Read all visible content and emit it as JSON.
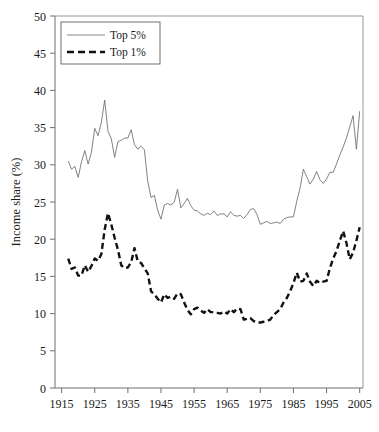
{
  "chart_data": {
    "type": "line",
    "title": "",
    "xlabel": "",
    "ylabel": "Income share (%)",
    "xlim": [
      1913,
      2006
    ],
    "ylim": [
      0,
      50
    ],
    "ytick_step": 5,
    "xtick_step": 10,
    "grid": false,
    "legend_position": "top-left",
    "xticks": [
      1915,
      1925,
      1935,
      1945,
      1955,
      1965,
      1975,
      1985,
      1995,
      2005
    ],
    "yticks": [
      0,
      5,
      10,
      15,
      20,
      25,
      30,
      35,
      40,
      45,
      50
    ],
    "x": [
      1917,
      1918,
      1919,
      1920,
      1921,
      1922,
      1923,
      1924,
      1925,
      1926,
      1927,
      1928,
      1929,
      1930,
      1931,
      1932,
      1933,
      1934,
      1935,
      1936,
      1937,
      1938,
      1939,
      1940,
      1941,
      1942,
      1943,
      1944,
      1945,
      1946,
      1947,
      1948,
      1949,
      1950,
      1951,
      1952,
      1953,
      1954,
      1955,
      1956,
      1957,
      1958,
      1959,
      1960,
      1961,
      1962,
      1963,
      1964,
      1965,
      1966,
      1967,
      1968,
      1969,
      1970,
      1971,
      1972,
      1973,
      1974,
      1975,
      1976,
      1977,
      1978,
      1979,
      1980,
      1981,
      1982,
      1983,
      1984,
      1985,
      1986,
      1987,
      1988,
      1989,
      1990,
      1991,
      1992,
      1993,
      1994,
      1995,
      1996,
      1997,
      1998,
      1999,
      2000,
      2001,
      2002,
      2003,
      2004,
      2005
    ],
    "series": [
      {
        "name": "Top 5%",
        "style": "solid-thin",
        "color": "#6b6b6b",
        "values": [
          30.5,
          29.4,
          29.8,
          28.3,
          30.4,
          31.9,
          30.1,
          31.7,
          34.9,
          33.9,
          35.7,
          38.7,
          34.5,
          33.5,
          31.0,
          33.1,
          33.3,
          33.6,
          33.6,
          34.7,
          32.7,
          32.1,
          32.5,
          32.0,
          27.8,
          25.6,
          25.9,
          23.9,
          22.7,
          24.6,
          24.8,
          24.6,
          25.0,
          26.7,
          24.2,
          24.8,
          25.5,
          24.5,
          23.9,
          23.8,
          23.4,
          23.2,
          23.5,
          23.3,
          23.8,
          23.2,
          23.4,
          23.4,
          23.0,
          23.7,
          23.2,
          23.1,
          23.2,
          22.8,
          23.3,
          24.0,
          24.1,
          23.3,
          22.0,
          22.2,
          22.4,
          22.1,
          22.2,
          22.3,
          22.1,
          22.7,
          22.9,
          23.0,
          23.0,
          25.1,
          26.9,
          29.4,
          28.4,
          27.4,
          28.1,
          29.1,
          28.0,
          27.5,
          28.1,
          29.0,
          29.0,
          30.1,
          31.3,
          32.4,
          33.6,
          35.1,
          36.6,
          32.1,
          37.2
        ]
      },
      {
        "name": "Top 1%",
        "style": "dashed-thick",
        "color": "#111111",
        "values": [
          17.4,
          16.0,
          16.2,
          15.1,
          15.1,
          16.5,
          15.6,
          16.4,
          17.4,
          17.1,
          18.0,
          21.3,
          23.5,
          22.0,
          20.2,
          18.6,
          16.5,
          16.1,
          16.2,
          16.9,
          18.8,
          17.0,
          16.8,
          16.1,
          15.4,
          13.0,
          12.6,
          12.0,
          11.5,
          12.6,
          12.1,
          12.3,
          12.0,
          12.7,
          12.6,
          11.5,
          10.5,
          9.9,
          10.6,
          10.8,
          10.4,
          10.1,
          10.6,
          10.2,
          10.2,
          10.1,
          10.0,
          10.3,
          10.0,
          10.6,
          10.2,
          10.7,
          10.6,
          9.2,
          9.3,
          9.4,
          9.0,
          8.8,
          8.8,
          8.9,
          9.0,
          9.2,
          9.8,
          10.2,
          10.6,
          11.5,
          12.1,
          13.0,
          14.1,
          15.5,
          14.3,
          14.4,
          15.4,
          14.3,
          13.7,
          14.4,
          14.1,
          14.3,
          14.4,
          16.1,
          17.4,
          18.4,
          19.8,
          21.1,
          19.5,
          17.3,
          18.2,
          19.8,
          21.6
        ]
      }
    ]
  },
  "legend": {
    "items": [
      {
        "label": "Top 5%"
      },
      {
        "label": "Top 1%"
      }
    ]
  },
  "axes": {
    "y_title": "Income share (%)"
  }
}
